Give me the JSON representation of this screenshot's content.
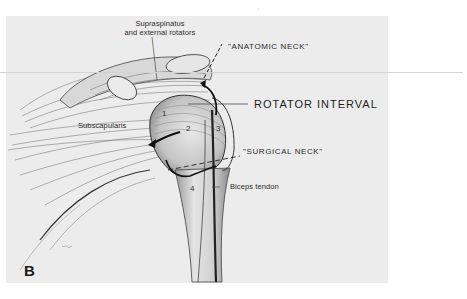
{
  "figure": {
    "panel_letter": "B",
    "signature": "JSD",
    "colors": {
      "background": "#ffffff",
      "panel": "#ececec",
      "ink": "#222222"
    }
  },
  "labels": {
    "supraspinatus_line1": "Supraspinatus",
    "supraspinatus_line2": "and external rotators",
    "anatomic_neck": "\"ANATOMIC NECK\"",
    "rotator_interval": "ROTATOR INTERVAL",
    "subscapularis": "Subscapularis",
    "surgical_neck": "\"SURGICAL NECK\"",
    "biceps_tendon": "Biceps tendon"
  },
  "numbers": {
    "n1": "1",
    "n2": "2",
    "n3": "3",
    "n4": "4"
  }
}
